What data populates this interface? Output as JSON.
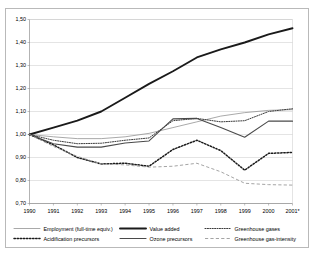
{
  "chart_data": {
    "type": "line",
    "title": "",
    "subtitle": "",
    "xlabel": "",
    "ylabel": "",
    "x": [
      "1990",
      "1991",
      "1992",
      "1993",
      "1994",
      "1995",
      "1996",
      "1997",
      "1998",
      "1999",
      "2000",
      "2001*"
    ],
    "xtick_labels": [
      "1990",
      "1991",
      "1992",
      "1993",
      "1994",
      "1995",
      "1996",
      "1997",
      "1998",
      "1999",
      "2000",
      "2001*"
    ],
    "ytick_labels": [
      "0,70",
      "0,80",
      "0,90",
      "1,00",
      "1,10",
      "1,20",
      "1,30",
      "1,40",
      "1,50"
    ],
    "ytick_values": [
      0.7,
      0.8,
      0.9,
      1.0,
      1.1,
      1.2,
      1.3,
      1.4,
      1.5
    ],
    "ylim": [
      0.7,
      1.5
    ],
    "grid": true,
    "legend_position": "bottom",
    "series": [
      {
        "name": "Employment (full-time equiv.)",
        "style": "solid-thin",
        "color": "#8c8c8c",
        "values": [
          1.0,
          0.99,
          0.982,
          0.982,
          0.99,
          1.005,
          1.03,
          1.055,
          1.08,
          1.095,
          1.105,
          1.108
        ]
      },
      {
        "name": "Value added",
        "style": "solid-thick",
        "color": "#1a1a1a",
        "values": [
          1.0,
          1.03,
          1.06,
          1.1,
          1.16,
          1.22,
          1.275,
          1.335,
          1.37,
          1.4,
          1.435,
          1.462
        ]
      },
      {
        "name": "Greenhouse gases",
        "style": "dotted",
        "color": "#3c3c3c",
        "values": [
          1.0,
          0.975,
          0.96,
          0.962,
          0.975,
          0.985,
          1.06,
          1.07,
          1.055,
          1.06,
          1.1,
          1.112
        ]
      },
      {
        "name": "Acidification precursors",
        "style": "dotted-bold",
        "color": "#1a1a1a",
        "values": [
          1.0,
          0.955,
          0.9,
          0.872,
          0.875,
          0.862,
          0.935,
          0.975,
          0.93,
          0.845,
          0.918,
          0.922
        ]
      },
      {
        "name": "Ozone precursors",
        "style": "solid-medium",
        "color": "#4a4a4a",
        "values": [
          1.0,
          0.96,
          0.945,
          0.945,
          0.963,
          0.972,
          1.068,
          1.07,
          1.03,
          0.988,
          1.058,
          1.058
        ]
      },
      {
        "name": "Greenhouse gas-intensity",
        "style": "dashed",
        "color": "#9a9a9a",
        "values": [
          1.0,
          0.948,
          0.905,
          0.872,
          0.868,
          0.858,
          0.862,
          0.875,
          0.838,
          0.788,
          0.782,
          0.78
        ]
      }
    ],
    "legend": [
      {
        "label": "Employment (full-time equiv.)",
        "style": "solid-thin",
        "color": "#8c8c8c"
      },
      {
        "label": "Value added",
        "style": "solid-thick",
        "color": "#1a1a1a"
      },
      {
        "label": "Greenhouse gases",
        "style": "dotted",
        "color": "#3c3c3c"
      },
      {
        "label": "Acidification precursors",
        "style": "dotted-bold",
        "color": "#1a1a1a"
      },
      {
        "label": "Ozone precursors",
        "style": "solid-medium",
        "color": "#4a4a4a"
      },
      {
        "label": "Greenhouse gas-intensity",
        "style": "dashed",
        "color": "#9a9a9a"
      }
    ]
  }
}
